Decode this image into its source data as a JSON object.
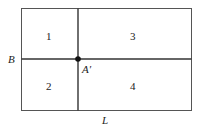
{
  "diagram": {
    "regions": [
      {
        "id": "1",
        "label": "1"
      },
      {
        "id": "2",
        "label": "2"
      },
      {
        "id": "3",
        "label": "3"
      },
      {
        "id": "4",
        "label": "4"
      }
    ],
    "axis_labels": {
      "horizontal_line": "B",
      "bottom_edge": "L"
    },
    "point": {
      "label": "A′"
    },
    "colors": {
      "stroke": "#333333",
      "background": "#ffffff"
    }
  }
}
